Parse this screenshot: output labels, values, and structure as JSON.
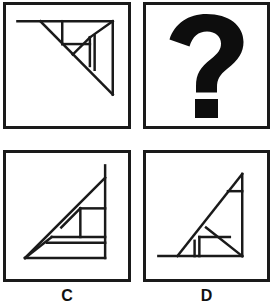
{
  "puzzle": {
    "type": "visual-analogy-matrix",
    "title": "Figure analogy puzzle",
    "rows": 2,
    "columns": 2,
    "stroke_color": "#1a1a1a",
    "background_color": "#ffffff",
    "border_width_px": 3,
    "panels": [
      {
        "id": "panel-a",
        "position": "top-left",
        "label": "",
        "content_kind": "figure",
        "figure_name": "tangram-triangle-upper-right",
        "description": "Right triangle with horizontal top edge and vertical right edge, hypotenuse falling from upper-left to lower-right, subdivided by internal tangram lines",
        "viewbox": "0 0 128 127",
        "lines": [
          {
            "name": "top-edge",
            "x1": 12,
            "y1": 17,
            "x2": 112,
            "y2": 17
          },
          {
            "name": "right-edge",
            "x1": 112,
            "y1": 17,
            "x2": 112,
            "y2": 94
          },
          {
            "name": "hypotenuse",
            "x1": 36,
            "y1": 17,
            "x2": 112,
            "y2": 94
          },
          {
            "name": "inner-vertical-left",
            "x1": 59,
            "y1": 17,
            "x2": 59,
            "y2": 41
          },
          {
            "name": "inner-horizontal-mid",
            "x1": 59,
            "y1": 41,
            "x2": 88,
            "y2": 41
          },
          {
            "name": "inner-diagonal-short",
            "x1": 70,
            "y1": 52,
            "x2": 88,
            "y2": 34
          },
          {
            "name": "inner-vertical-right-a",
            "x1": 88,
            "y1": 34,
            "x2": 88,
            "y2": 64
          },
          {
            "name": "inner-vertical-right-b",
            "x1": 93,
            "y1": 32,
            "x2": 93,
            "y2": 68
          },
          {
            "name": "inner-diagonal-corner",
            "x1": 88,
            "y1": 34,
            "x2": 112,
            "y2": 17
          }
        ]
      },
      {
        "id": "panel-b",
        "position": "top-right",
        "label": "",
        "content_kind": "question-mark",
        "figure_name": "question-mark-glyph",
        "description": "Large bold black question mark indicating the missing figure"
      },
      {
        "id": "panel-c",
        "position": "bottom-left",
        "label": "C",
        "content_kind": "figure",
        "figure_name": "tangram-triangle-lower-right",
        "description": "Right triangle with horizontal bottom edge and vertical right edge, hypotenuse rising from lower-left to upper-right, subdivided by internal tangram lines",
        "viewbox": "0 0 128 132",
        "lines": [
          {
            "name": "bottom-edge",
            "x1": 20,
            "y1": 110,
            "x2": 104,
            "y2": 110
          },
          {
            "name": "right-edge",
            "x1": 104,
            "y1": 110,
            "x2": 104,
            "y2": 13
          },
          {
            "name": "hypotenuse",
            "x1": 20,
            "y1": 110,
            "x2": 104,
            "y2": 26
          },
          {
            "name": "inner-horizontal-upper",
            "x1": 78,
            "y1": 58,
            "x2": 104,
            "y2": 58
          },
          {
            "name": "inner-vertical-mid",
            "x1": 78,
            "y1": 58,
            "x2": 78,
            "y2": 88
          },
          {
            "name": "inner-diagonal-short",
            "x1": 58,
            "y1": 78,
            "x2": 78,
            "y2": 58
          },
          {
            "name": "inner-horizontal-lower-a",
            "x1": 48,
            "y1": 88,
            "x2": 104,
            "y2": 88
          },
          {
            "name": "inner-horizontal-lower-b",
            "x1": 43,
            "y1": 94,
            "x2": 104,
            "y2": 94
          },
          {
            "name": "inner-diagonal-corner",
            "x1": 48,
            "y1": 88,
            "x2": 20,
            "y2": 110
          }
        ]
      },
      {
        "id": "panel-d",
        "position": "bottom-right",
        "label": "D",
        "content_kind": "figure",
        "figure_name": "tangram-triangle-lower-right-wide",
        "description": "Right triangle with long horizontal bottom edge extending left, vertical right edge, hypotenuse rising from lower-left to upper-right, subdivided by internal tangram lines",
        "viewbox": "0 0 127 132",
        "lines": [
          {
            "name": "bottom-edge",
            "x1": 13,
            "y1": 108,
            "x2": 101,
            "y2": 108
          },
          {
            "name": "right-edge",
            "x1": 101,
            "y1": 108,
            "x2": 101,
            "y2": 22
          },
          {
            "name": "hypotenuse",
            "x1": 33,
            "y1": 108,
            "x2": 101,
            "y2": 22
          },
          {
            "name": "inner-horizontal-top",
            "x1": 86,
            "y1": 40,
            "x2": 101,
            "y2": 40
          },
          {
            "name": "inner-diagonal-mid",
            "x1": 63,
            "y1": 78,
            "x2": 101,
            "y2": 108
          },
          {
            "name": "inner-horizontal-mid",
            "x1": 56,
            "y1": 88,
            "x2": 88,
            "y2": 88
          },
          {
            "name": "inner-vertical-a",
            "x1": 56,
            "y1": 88,
            "x2": 56,
            "y2": 108
          },
          {
            "name": "inner-vertical-b",
            "x1": 51,
            "y1": 92,
            "x2": 51,
            "y2": 108
          }
        ]
      }
    ]
  }
}
